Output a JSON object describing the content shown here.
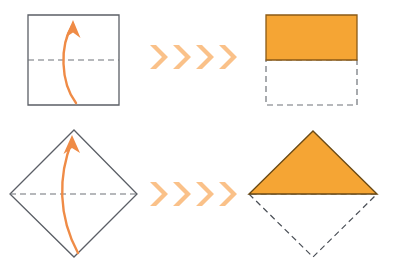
{
  "figure": {
    "title": "Paper folding diagram: square and diamond folded in half",
    "canvas": {
      "width": 394,
      "height": 271,
      "background": "#ffffff"
    },
    "colors": {
      "orange_fill": "#f5a534",
      "orange_edge": "#8a5a16",
      "arrow_orange": "#ef8b46",
      "chevron_orange": "#fac189",
      "outline_gray": "#5b5f66",
      "dashed_gray": "#6e7278",
      "background": "#ffffff"
    },
    "rows": [
      {
        "id": "row-square",
        "label": "square-fold-row",
        "before": {
          "name": "square-unfolded",
          "shape": "square",
          "points": "28,15 119,15 119,105 28,105",
          "fold_line": {
            "name": "horizontal-fold-crease",
            "points": "28,60 119,60"
          },
          "arrow": {
            "name": "fold-up-arrow",
            "path": "M 76,103 C 60,82 60,45 72,26",
            "tip": "66,36 73,21 80,37 73,32"
          }
        },
        "separator": {
          "name": "chevron-arrows",
          "count": 4,
          "glyph": "chevron-right-icon",
          "positions": [
            150,
            173,
            196,
            219
          ],
          "y_top": 45,
          "y_bottom": 69
        },
        "after": {
          "name": "square-folded",
          "folded_shape": {
            "name": "folded-top-half-rectangle",
            "points": "266,15 357,15 357,60 266,60",
            "filled": true
          },
          "ghost_shape": {
            "name": "hidden-bottom-half-outline",
            "points": "266,60 357,60 357,105 266,105",
            "filled": false,
            "dashed": true
          }
        }
      },
      {
        "id": "row-diamond",
        "label": "diamond-fold-row",
        "before": {
          "name": "diamond-unfolded",
          "shape": "diamond",
          "points": "74,130 137,194 74,257 10,194",
          "fold_line": {
            "name": "horizontal-fold-crease",
            "points": "10,194 137,194"
          },
          "arrow": {
            "name": "fold-up-arrow",
            "path": "M 78,253 C 58,216 58,176 72,141",
            "tip": "64,152 73,136 80,153 73,147"
          }
        },
        "separator": {
          "name": "chevron-arrows",
          "count": 4,
          "glyph": "chevron-right-icon",
          "positions": [
            150,
            173,
            196,
            219
          ],
          "y_top": 182,
          "y_bottom": 206
        },
        "after": {
          "name": "diamond-folded",
          "folded_shape": {
            "name": "folded-top-half-triangle",
            "points": "313,131 377,194 249,194",
            "filled": true
          },
          "ghost_shape": {
            "name": "hidden-bottom-half-outline",
            "points": "249,194 313,257 377,194",
            "filled": false,
            "dashed": true
          }
        }
      }
    ]
  }
}
